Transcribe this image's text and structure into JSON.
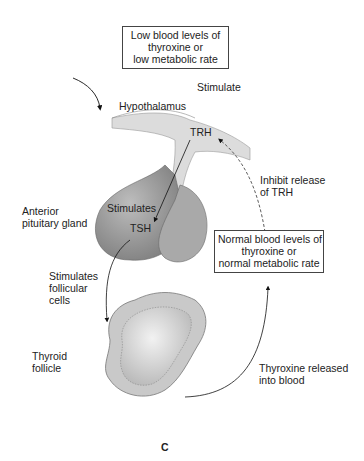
{
  "boxes": {
    "low": {
      "lines": [
        "Low blood levels of",
        "thyroxine or",
        "low metabolic rate"
      ]
    },
    "normal": {
      "lines": [
        "Normal blood levels of",
        "thyroxine or",
        "normal metabolic rate"
      ]
    }
  },
  "labels": {
    "stimulate": "Stimulate",
    "hypothalamus": "Hypothalamus",
    "trh": "TRH",
    "inhibit_1": "Inhibit release",
    "inhibit_2": "of TRH",
    "anterior_1": "Anterior",
    "anterior_2": "pituitary gland",
    "stimulates": "Stimulates",
    "tsh": "TSH",
    "stim_foll_1": "Stimulates",
    "stim_foll_2": "follicular",
    "stim_foll_3": "cells",
    "thyroid_1": "Thyroid",
    "thyroid_2": "follicle",
    "released_1": "Thyroxine released",
    "released_2": "into blood",
    "panel": "C"
  }
}
